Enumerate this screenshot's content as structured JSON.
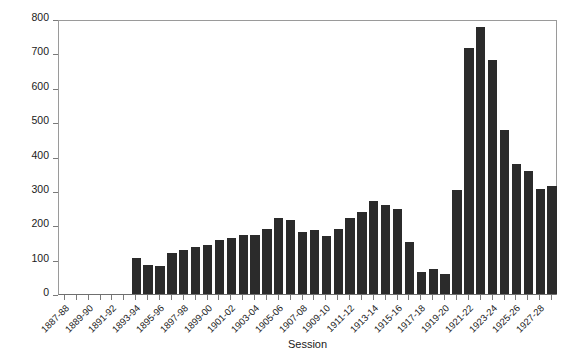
{
  "chart_data": {
    "type": "bar",
    "title": "",
    "xlabel": "Session",
    "ylabel": "",
    "ylim": [
      0,
      800
    ],
    "yticks": [
      0,
      100,
      200,
      300,
      400,
      500,
      600,
      700,
      800
    ],
    "grid": false,
    "legend": null,
    "bar_color": "#2b2b2b",
    "axis_color": "#7a7a7a",
    "label_every_n": 2,
    "categories": [
      "1887-88",
      "1888-89",
      "1889-90",
      "1890-91",
      "1891-92",
      "1892-93",
      "1893-94",
      "1894-95",
      "1895-96",
      "1896-97",
      "1897-98",
      "1898-99",
      "1899-00",
      "1900-01",
      "1901-02",
      "1902-03",
      "1903-04",
      "1904-05",
      "1905-06",
      "1906-07",
      "1907-08",
      "1908-09",
      "1909-10",
      "1910-11",
      "1911-12",
      "1912-13",
      "1913-14",
      "1914-15",
      "1915-16",
      "1916-17",
      "1917-18",
      "1918-19",
      "1919-20",
      "1920-21",
      "1921-22",
      "1922-23",
      "1923-24",
      "1924-25",
      "1925-26",
      "1926-27",
      "1927-28",
      "1928-29"
    ],
    "values": [
      0,
      0,
      0,
      0,
      0,
      0,
      105,
      85,
      82,
      118,
      128,
      138,
      142,
      158,
      163,
      172,
      172,
      190,
      222,
      215,
      180,
      185,
      168,
      190,
      222,
      238,
      272,
      258,
      248,
      150,
      65,
      72,
      57,
      302,
      715,
      778,
      680,
      478,
      378,
      358,
      305,
      315
    ],
    "tick_labels": [
      "1887-88",
      "1889-90",
      "1891-92",
      "1893-94",
      "1895-96",
      "1897-98",
      "1899-00",
      "1901-02",
      "1903-04",
      "1905-06",
      "1907-08",
      "1909-10",
      "1911-12",
      "1913-14",
      "1915-16",
      "1917-18",
      "1919-20",
      "1921-22",
      "1923-24",
      "1925-26",
      "1927-28"
    ]
  }
}
